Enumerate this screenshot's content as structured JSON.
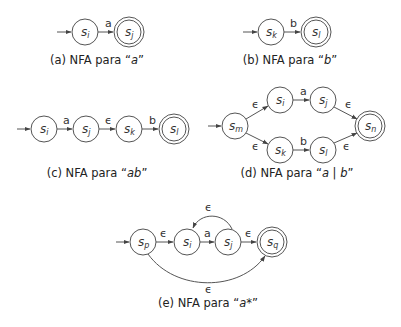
{
  "diagram": {
    "panels": [
      {
        "id": "a",
        "caption_prefix": "(a) NFA para “",
        "caption_expr": "a",
        "caption_suffix": "”",
        "states": [
          {
            "name": "s",
            "sub": "i",
            "final": false,
            "start": true
          },
          {
            "name": "s",
            "sub": "j",
            "final": true
          }
        ],
        "transitions": [
          {
            "from": "s_i",
            "to": "s_j",
            "label": "a"
          }
        ]
      },
      {
        "id": "b",
        "caption_prefix": "(b) NFA para “",
        "caption_expr": "b",
        "caption_suffix": "”",
        "states": [
          {
            "name": "s",
            "sub": "k",
            "final": false,
            "start": true
          },
          {
            "name": "s",
            "sub": "l",
            "final": true
          }
        ],
        "transitions": [
          {
            "from": "s_k",
            "to": "s_l",
            "label": "b"
          }
        ]
      },
      {
        "id": "c",
        "caption_prefix": "(c) NFA para “",
        "caption_expr": "ab",
        "caption_suffix": "”",
        "states": [
          {
            "name": "s",
            "sub": "i",
            "final": false,
            "start": true
          },
          {
            "name": "s",
            "sub": "j",
            "final": false
          },
          {
            "name": "s",
            "sub": "k",
            "final": false
          },
          {
            "name": "s",
            "sub": "l",
            "final": true
          }
        ],
        "transitions": [
          {
            "from": "s_i",
            "to": "s_j",
            "label": "a"
          },
          {
            "from": "s_j",
            "to": "s_k",
            "label": "ϵ"
          },
          {
            "from": "s_k",
            "to": "s_l",
            "label": "b"
          }
        ]
      },
      {
        "id": "d",
        "caption_prefix": "(d) NFA para “",
        "caption_expr": "a | b",
        "caption_suffix": "”",
        "states": [
          {
            "name": "s",
            "sub": "m",
            "final": false,
            "start": true
          },
          {
            "name": "s",
            "sub": "i",
            "final": false
          },
          {
            "name": "s",
            "sub": "j",
            "final": false
          },
          {
            "name": "s",
            "sub": "k",
            "final": false
          },
          {
            "name": "s",
            "sub": "l",
            "final": false
          },
          {
            "name": "s",
            "sub": "n",
            "final": true
          }
        ],
        "transitions": [
          {
            "from": "s_m",
            "to": "s_i",
            "label": "ϵ"
          },
          {
            "from": "s_m",
            "to": "s_k",
            "label": "ϵ"
          },
          {
            "from": "s_i",
            "to": "s_j",
            "label": "a"
          },
          {
            "from": "s_k",
            "to": "s_l",
            "label": "b"
          },
          {
            "from": "s_j",
            "to": "s_n",
            "label": "ϵ"
          },
          {
            "from": "s_l",
            "to": "s_n",
            "label": "ϵ"
          }
        ]
      },
      {
        "id": "e",
        "caption_prefix": "(e) NFA para “",
        "caption_expr": "a*",
        "caption_suffix": "”",
        "states": [
          {
            "name": "s",
            "sub": "p",
            "final": false,
            "start": true
          },
          {
            "name": "s",
            "sub": "i",
            "final": false
          },
          {
            "name": "s",
            "sub": "j",
            "final": false
          },
          {
            "name": "s",
            "sub": "q",
            "final": true
          }
        ],
        "transitions": [
          {
            "from": "s_p",
            "to": "s_i",
            "label": "ϵ"
          },
          {
            "from": "s_i",
            "to": "s_j",
            "label": "a"
          },
          {
            "from": "s_j",
            "to": "s_q",
            "label": "ϵ"
          },
          {
            "from": "s_j",
            "to": "s_i",
            "label": "ϵ"
          },
          {
            "from": "s_p",
            "to": "s_q",
            "label": "ϵ"
          }
        ]
      }
    ]
  }
}
